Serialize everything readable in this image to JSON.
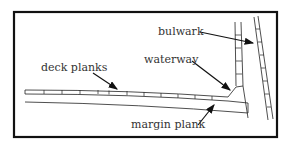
{
  "diagram": {
    "labels": {
      "bulwark": "bulwark",
      "waterway": "waterway",
      "deck_planks": "deck planks",
      "margin_plank": "margin plank"
    },
    "colors": {
      "line": "#222222",
      "frame": "#111111",
      "text": "#333333",
      "background": "#ffffff"
    }
  }
}
